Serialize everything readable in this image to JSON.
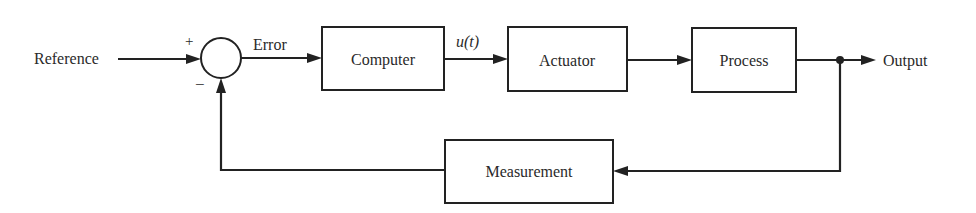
{
  "diagram": {
    "type": "feedback-control-block-diagram",
    "colors": {
      "line": "#222222",
      "text": "#2a2a2a",
      "background": "#ffffff"
    },
    "input_label": "Reference",
    "output_label": "Output",
    "summing_junction": {
      "plus_sign": "+",
      "minus_sign": "−"
    },
    "signals": {
      "error": "Error",
      "control": "u(t)"
    },
    "blocks": {
      "computer": "Computer",
      "actuator": "Actuator",
      "process": "Process",
      "measurement": "Measurement"
    }
  }
}
